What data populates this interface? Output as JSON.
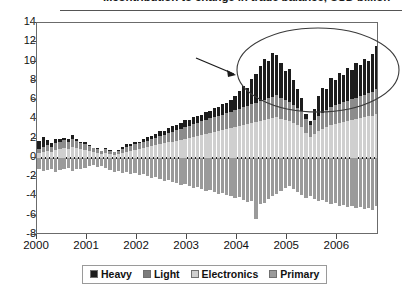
{
  "title": {
    "text": "...contribution to change in trade balance, USD billion",
    "clipped": true
  },
  "legend": {
    "position": "bottom-center",
    "items": [
      {
        "label": "Heavy",
        "color": "#1d1d1d"
      },
      {
        "label": "Light",
        "color": "#7c7c7c"
      },
      {
        "label": "Electronics",
        "color": "#cfcfcf"
      },
      {
        "label": "Primary",
        "color": "#9a9a9a"
      }
    ]
  },
  "annotations": [
    {
      "type": "ellipse",
      "name": "highlight-ellipse",
      "note": "circles the tall Heavy-industry spike region 2005-2006"
    },
    {
      "type": "arrow",
      "name": "callout-arrow",
      "note": "arrow pointing right toward the highlighted ellipse"
    }
  ],
  "chart_data": {
    "type": "bar",
    "stacked": true,
    "title": "...contribution to change in trade balance, USD billion",
    "xlabel": "",
    "ylabel": "",
    "ylim": [
      -8,
      14
    ],
    "ytick_step": 2,
    "yticks": [
      14,
      12,
      10,
      8,
      6,
      4,
      2,
      0,
      -2,
      -4,
      -6,
      -8
    ],
    "grid": false,
    "xlim_labels": [
      "2000",
      "2001",
      "2002",
      "2003",
      "2004",
      "2005",
      "2006"
    ],
    "x_tick_labels": [
      "2000",
      "2001",
      "2002",
      "2003",
      "2004",
      "2005",
      "2006"
    ],
    "x_note": "monthly observations, Jan 2000 through late 2006",
    "n_points": 82,
    "series": [
      {
        "name": "Electronics",
        "color": "#cfcfcf",
        "values": [
          0.5,
          0.6,
          0.7,
          0.6,
          0.8,
          0.9,
          1.0,
          0.9,
          1.1,
          1.0,
          0.9,
          0.8,
          0.7,
          0.6,
          0.5,
          0.4,
          0.5,
          0.4,
          0.3,
          0.4,
          0.5,
          0.6,
          0.7,
          0.8,
          0.9,
          1.0,
          1.1,
          1.2,
          1.3,
          1.4,
          1.5,
          1.6,
          1.7,
          1.8,
          1.9,
          2.0,
          2.1,
          2.2,
          2.3,
          2.4,
          2.5,
          2.6,
          2.7,
          2.8,
          2.9,
          3.0,
          3.1,
          3.2,
          3.3,
          3.4,
          3.5,
          3.6,
          3.7,
          3.8,
          3.9,
          4.0,
          4.1,
          4.2,
          4.0,
          3.9,
          3.8,
          3.6,
          3.4,
          3.2,
          2.6,
          2.2,
          2.5,
          2.8,
          3.0,
          3.2,
          3.4,
          3.5,
          3.6,
          3.7,
          3.8,
          3.9,
          4.0,
          4.1,
          4.2,
          4.3,
          4.4,
          4.6
        ]
      },
      {
        "name": "Light",
        "color": "#8c8c8c",
        "values": [
          0.4,
          0.5,
          0.6,
          0.5,
          0.7,
          0.8,
          0.9,
          0.8,
          0.9,
          0.8,
          0.7,
          0.6,
          0.5,
          0.4,
          0.4,
          0.3,
          0.4,
          0.3,
          0.3,
          0.3,
          0.4,
          0.5,
          0.5,
          0.6,
          0.6,
          0.7,
          0.7,
          0.8,
          0.8,
          0.9,
          0.9,
          1.0,
          1.0,
          1.1,
          1.1,
          1.2,
          1.2,
          1.3,
          1.3,
          1.4,
          1.4,
          1.5,
          1.5,
          1.6,
          1.6,
          1.7,
          1.7,
          1.8,
          1.8,
          1.9,
          1.9,
          2.0,
          2.0,
          2.1,
          2.1,
          2.2,
          2.2,
          2.3,
          2.2,
          2.1,
          2.0,
          1.9,
          1.8,
          1.7,
          1.4,
          1.2,
          1.4,
          1.6,
          1.7,
          1.8,
          1.9,
          2.0,
          2.0,
          2.1,
          2.1,
          2.2,
          2.2,
          2.3,
          2.3,
          2.4,
          2.4,
          2.5
        ]
      },
      {
        "name": "Heavy",
        "color": "#1d1d1d",
        "values": [
          0.9,
          1.1,
          0.6,
          0.4,
          0.5,
          0.3,
          0.2,
          0.3,
          0.4,
          0.2,
          0.1,
          0.2,
          0.1,
          0.0,
          0.1,
          0.0,
          0.1,
          0.1,
          0.0,
          0.1,
          0.2,
          0.3,
          0.2,
          0.3,
          0.2,
          0.3,
          0.4,
          0.3,
          0.4,
          0.5,
          0.4,
          0.5,
          0.6,
          0.5,
          0.6,
          0.7,
          0.6,
          0.7,
          0.8,
          0.7,
          0.9,
          0.8,
          1.0,
          0.9,
          1.1,
          1.0,
          1.2,
          1.4,
          1.8,
          2.2,
          1.9,
          2.6,
          3.0,
          3.6,
          4.3,
          3.9,
          4.6,
          4.2,
          3.6,
          3.0,
          3.4,
          2.6,
          2.0,
          1.3,
          0.6,
          0.4,
          1.2,
          2.0,
          2.6,
          2.2,
          3.0,
          2.6,
          3.2,
          2.8,
          3.4,
          3.0,
          3.6,
          3.2,
          3.8,
          3.4,
          4.0,
          4.5
        ]
      },
      {
        "name": "Primary",
        "color": "#9a9a9a",
        "values": [
          -1.2,
          -1.4,
          -1.3,
          -1.1,
          -1.5,
          -1.3,
          -1.2,
          -1.0,
          -1.4,
          -1.2,
          -1.1,
          -1.0,
          -0.8,
          -0.7,
          -0.9,
          -0.8,
          -1.0,
          -1.3,
          -1.5,
          -1.4,
          -1.6,
          -1.5,
          -1.7,
          -1.6,
          -1.8,
          -1.7,
          -1.9,
          -2.1,
          -2.0,
          -2.2,
          -2.4,
          -2.3,
          -2.5,
          -2.6,
          -2.8,
          -2.7,
          -2.9,
          -3.1,
          -3.0,
          -3.2,
          -3.4,
          -3.3,
          -3.5,
          -3.7,
          -3.6,
          -3.8,
          -4.0,
          -4.2,
          -4.1,
          -4.4,
          -4.6,
          -4.5,
          -6.3,
          -4.8,
          -4.7,
          -4.3,
          -4.0,
          -3.7,
          -3.4,
          -3.1,
          -2.9,
          -3.2,
          -3.5,
          -3.8,
          -4.2,
          -4.0,
          -4.3,
          -4.5,
          -4.4,
          -4.6,
          -4.8,
          -4.7,
          -5.0,
          -4.9,
          -5.1,
          -5.0,
          -5.2,
          -5.1,
          -5.3,
          -5.2,
          -5.4,
          -5.0
        ]
      }
    ]
  }
}
